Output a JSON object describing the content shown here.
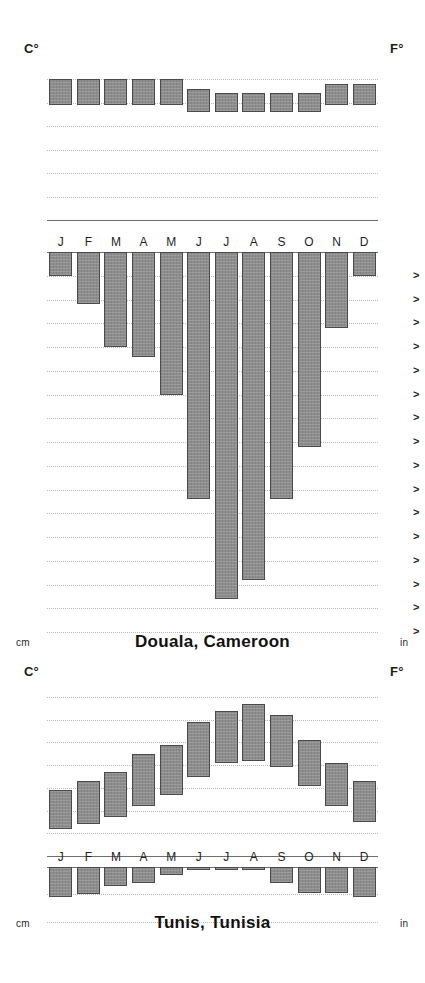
{
  "figure": {
    "type": "climograph-pair",
    "bar_color": "#8d8d8d",
    "bar_border_color": "#4a4a4a",
    "grid_color": "#b9b9b9",
    "axis_color": "#6e6e6e",
    "months": [
      "J",
      "F",
      "M",
      "A",
      "M",
      "J",
      "J",
      "A",
      "S",
      "O",
      "N",
      "D"
    ]
  },
  "panels": [
    {
      "id": "douala",
      "title": "Douala, Cameroon",
      "temperature": {
        "left_unit": "C°",
        "right_unit": "F°",
        "left_ticks": [
          30,
          25,
          20,
          15,
          10,
          5,
          0
        ],
        "right_ticks": [
          86,
          77,
          68,
          59,
          50,
          41,
          32
        ],
        "ylim_c": [
          0,
          32
        ],
        "series_name": "Monthly temperature range",
        "low_c": [
          24.5,
          24.5,
          24.5,
          24.5,
          24.5,
          23.0,
          23.0,
          23.0,
          23.0,
          23.0,
          24.5,
          24.5
        ],
        "high_c": [
          30.0,
          30.0,
          30.0,
          30.0,
          30.0,
          28.0,
          27.0,
          27.0,
          27.0,
          27.0,
          29.0,
          29.0
        ]
      },
      "precipitation": {
        "left_unit": "cm",
        "right_unit": "in",
        "left_ticks": [
          0,
          5,
          10,
          15,
          20,
          25,
          30,
          35,
          40,
          45,
          50,
          55,
          60,
          65,
          70,
          75,
          80
        ],
        "right_ticks": [
          0,
          2,
          4,
          6,
          8,
          10,
          12,
          14,
          16,
          18,
          20,
          22,
          24,
          26,
          28,
          30,
          32
        ],
        "right_tick_marker": ">",
        "ylim_cm": [
          0,
          80
        ],
        "series_name": "Monthly precipitation",
        "values_cm": [
          5,
          11,
          20,
          22,
          30,
          52,
          73,
          69,
          52,
          41,
          16,
          5
        ]
      }
    },
    {
      "id": "tunis",
      "title": "Tunis, Tunisia",
      "temperature": {
        "left_unit": "C°",
        "right_unit": "F°",
        "left_ticks": [
          35,
          30,
          25,
          20,
          15,
          10,
          5,
          0
        ],
        "right_ticks": [
          95,
          86,
          77,
          68,
          59,
          50,
          41,
          32
        ],
        "ylim_c": [
          0,
          37
        ],
        "series_name": "Monthly temperature range",
        "low_c": [
          6.0,
          7.0,
          8.5,
          11.0,
          13.5,
          17.5,
          20.5,
          21.0,
          19.5,
          15.5,
          11.0,
          7.5
        ],
        "high_c": [
          14.5,
          16.5,
          18.5,
          22.5,
          24.5,
          29.5,
          32.0,
          33.5,
          31.0,
          25.5,
          20.5,
          16.5
        ]
      },
      "precipitation": {
        "left_unit": "cm",
        "right_unit": "in",
        "left_ticks": [
          0,
          5,
          10
        ],
        "right_ticks": [
          0,
          2,
          4
        ],
        "ylim_cm": [
          0,
          11
        ],
        "series_name": "Monthly precipitation",
        "values_cm": [
          5.5,
          5.0,
          3.5,
          3.0,
          1.5,
          0.5,
          0.2,
          0.5,
          3.0,
          4.8,
          4.8,
          5.5
        ]
      }
    }
  ]
}
